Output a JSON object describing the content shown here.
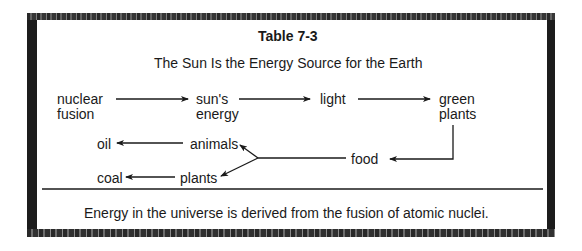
{
  "table": {
    "title": "Table 7-3",
    "subtitle": "The Sun Is the Energy Source for the Earth",
    "caption": "Energy in the universe is derived from the fusion of atomic nuclei."
  },
  "nodes": {
    "nuclear_fusion": [
      "nuclear",
      "fusion"
    ],
    "suns_energy": [
      "sun's",
      "energy"
    ],
    "light": "light",
    "green_plants": [
      "green",
      "plants"
    ],
    "food": "food",
    "animals": "animals",
    "plants": "plants",
    "oil": "oil",
    "coal": "coal"
  },
  "edges": [
    {
      "from": "nuclear fusion",
      "to": "sun's energy"
    },
    {
      "from": "sun's energy",
      "to": "light"
    },
    {
      "from": "light",
      "to": "green plants"
    },
    {
      "from": "green plants",
      "to": "food"
    },
    {
      "from": "food",
      "to": "animals"
    },
    {
      "from": "food",
      "to": "plants"
    },
    {
      "from": "animals",
      "to": "oil"
    },
    {
      "from": "plants",
      "to": "coal"
    }
  ],
  "colors": {
    "border": "#1c1c1c",
    "text": "#1a1a1a",
    "background": "#ffffff"
  }
}
